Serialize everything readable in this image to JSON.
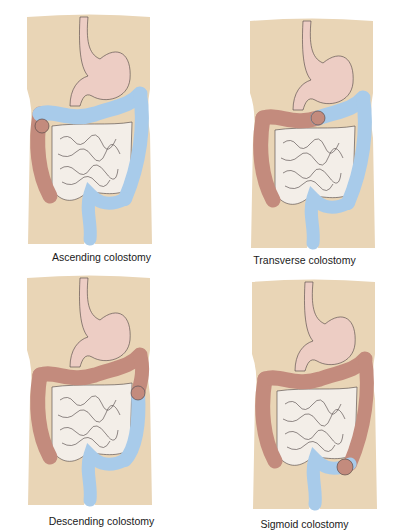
{
  "figure": {
    "colors": {
      "torso": "#e9d5b6",
      "stomach": "#edcdc4",
      "small_intestine": "#f3eee8",
      "outline": "#4a4040",
      "colostomy_active": "#c38b7d",
      "colostomy_inactive": "#a8cbea"
    },
    "panels": [
      {
        "id": "ascending",
        "caption": "Ascending colostomy",
        "segments": {
          "ascending": "active",
          "transverse": "inactive",
          "descending": "inactive",
          "sigmoid": "inactive"
        }
      },
      {
        "id": "transverse",
        "caption": "Transverse colostomy",
        "segments": {
          "ascending": "active",
          "transverse": "split",
          "descending": "inactive",
          "sigmoid": "inactive"
        }
      },
      {
        "id": "descending",
        "caption": "Descending colostomy",
        "segments": {
          "ascending": "active",
          "transverse": "active",
          "descending": "split",
          "sigmoid": "inactive"
        }
      },
      {
        "id": "sigmoid",
        "caption": "Sigmoid colostomy",
        "segments": {
          "ascending": "active",
          "transverse": "active",
          "descending": "active",
          "sigmoid": "inactive"
        }
      }
    ]
  }
}
